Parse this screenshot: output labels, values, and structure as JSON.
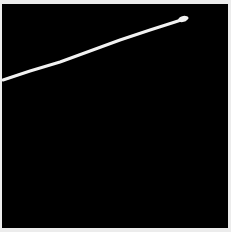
{
  "image": {
    "description": "Black field with a single white stroke rising diagonally from lower-left to upper-right",
    "background_color": "#000000",
    "border_color": "#ececec",
    "stroke": {
      "color": "#f2f2f2",
      "width": 3,
      "points": [
        [
          3,
          80
        ],
        [
          30,
          71
        ],
        [
          60,
          62
        ],
        [
          90,
          51
        ],
        [
          120,
          40
        ],
        [
          150,
          30
        ],
        [
          175,
          22
        ],
        [
          187,
          18
        ]
      ]
    }
  }
}
